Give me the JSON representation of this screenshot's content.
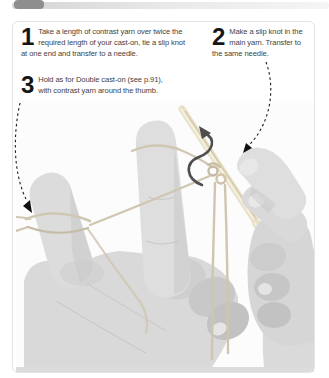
{
  "instructions": {
    "steps": [
      {
        "number": "1",
        "text": "Take a length of contrast yarn over twice the required length of your cast-on, tie a slip knot at one end and transfer to a needle."
      },
      {
        "number": "2",
        "text": "Make a slip knot in the main yarn. Transfer to the same needle."
      },
      {
        "number": "3",
        "text": "Hold as for Double cast-on (see p.91), with contrast yarn around the thumb."
      }
    ],
    "number_color": "#161616",
    "text_color": "#3f3f3f"
  },
  "decor": {
    "top_tab_color": "#8e8e8e",
    "top_bar_color": "#d4d4d4",
    "panel_border_color": "#e3e3e3"
  },
  "photo": {
    "needle_color": "#e9e0c8",
    "yarn_color": "#d0c7b2",
    "twist_arrow_color": "#4e4e4e",
    "guide_arrow_color": "#1c1c1c"
  }
}
